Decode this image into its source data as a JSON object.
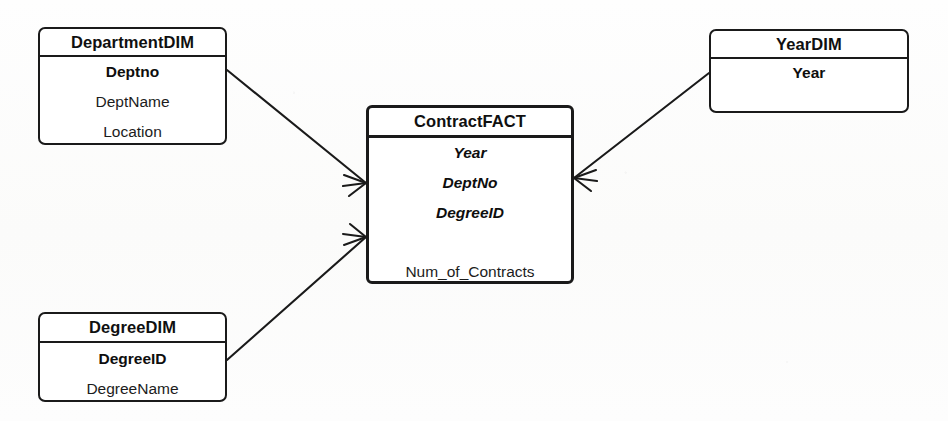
{
  "diagram": {
    "notation": "crow's-foot",
    "background_color": "#fdfdfc",
    "line_color": "#1a1a1a",
    "text_color": "#141414"
  },
  "entities": [
    {
      "id": "department-dim",
      "name": "DepartmentDIM",
      "kind": "dimension",
      "x": 38,
      "y": 27,
      "width": 189,
      "height": 118,
      "title_height": 28,
      "attributes": [
        {
          "label": "Deptno",
          "role": "key"
        },
        {
          "label": "DeptName",
          "role": "plain"
        },
        {
          "label": "Location",
          "role": "plain"
        }
      ]
    },
    {
      "id": "contract-fact",
      "name": "ContractFACT",
      "kind": "fact",
      "x": 366,
      "y": 105,
      "width": 208,
      "height": 179,
      "title_height": 30,
      "attributes": [
        {
          "label": "Year",
          "role": "fk"
        },
        {
          "label": "DeptNo",
          "role": "fk"
        },
        {
          "label": "DegreeID",
          "role": "fk"
        },
        {
          "label": "",
          "role": "spacer"
        },
        {
          "label": "Num_of_Contracts",
          "role": "measure"
        }
      ]
    },
    {
      "id": "year-dim",
      "name": "YearDIM",
      "kind": "dimension",
      "x": 709,
      "y": 29,
      "width": 200,
      "height": 84,
      "title_height": 28,
      "attributes": [
        {
          "label": "Year",
          "role": "key"
        },
        {
          "label": "",
          "role": "spacer"
        }
      ]
    },
    {
      "id": "degree-dim",
      "name": "DegreeDIM",
      "kind": "dimension",
      "x": 38,
      "y": 312,
      "width": 189,
      "height": 90,
      "title_height": 29,
      "attributes": [
        {
          "label": "DegreeID",
          "role": "key"
        },
        {
          "label": "DegreeName",
          "role": "plain"
        }
      ]
    }
  ],
  "relationships": [
    {
      "id": "department-to-contract",
      "from_entity": "DepartmentDIM",
      "to_entity": "ContractFACT",
      "from_cardinality": "one",
      "to_cardinality": "many",
      "from_point": {
        "x": 227,
        "y": 70
      },
      "to_point": {
        "x": 366,
        "y": 183
      }
    },
    {
      "id": "year-to-contract",
      "from_entity": "YearDIM",
      "to_entity": "ContractFACT",
      "from_cardinality": "one",
      "to_cardinality": "many",
      "from_point": {
        "x": 709,
        "y": 73
      },
      "to_point": {
        "x": 574,
        "y": 178
      }
    },
    {
      "id": "degree-to-contract",
      "from_entity": "DegreeDIM",
      "to_entity": "ContractFACT",
      "from_cardinality": "one",
      "to_cardinality": "many",
      "from_point": {
        "x": 227,
        "y": 360
      },
      "to_point": {
        "x": 366,
        "y": 237
      }
    }
  ]
}
